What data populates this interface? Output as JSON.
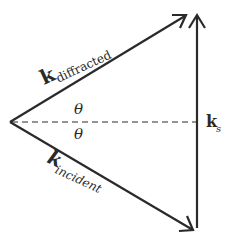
{
  "diagram": {
    "type": "vector-diagram",
    "colors": {
      "line": "#2a2a2a",
      "background": "#ffffff"
    },
    "vectors": {
      "diffracted": {
        "symbol": "k",
        "subscript": "diffracted"
      },
      "incident": {
        "symbol": "k",
        "subscript": "incident"
      },
      "scattering": {
        "symbol": "k",
        "subscript": "s"
      }
    },
    "angles": {
      "upper": "θ",
      "lower": "θ"
    }
  }
}
